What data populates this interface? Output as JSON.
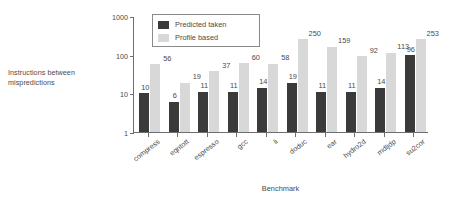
{
  "chart_data": {
    "type": "bar",
    "title": "",
    "xlabel": "Benchmark",
    "ylabel": "Instructions between mispredictions",
    "ylabel_line1": "Instructions between",
    "ylabel_line2": "mispredictions",
    "yscale": "log",
    "ylim": [
      1,
      1000
    ],
    "yticks": [
      1,
      10,
      100,
      1000
    ],
    "ytick_labels": [
      "1",
      "10",
      "100",
      "1000"
    ],
    "grid": false,
    "legend_position": "top-center",
    "categories": [
      "compress",
      "eqntott",
      "espresso",
      "gcc",
      "li",
      "doduc",
      "ear",
      "hydro2d",
      "mdljdp",
      "su2cor"
    ],
    "series": [
      {
        "name": "Predicted taken",
        "color": "#3a3a3a",
        "values": [
          10,
          6,
          11,
          11,
          14,
          19,
          11,
          11,
          14,
          96
        ]
      },
      {
        "name": "Profile based",
        "color": "#d8d8d8",
        "values": [
          56,
          19,
          37,
          60,
          58,
          250,
          159,
          92,
          113,
          253
        ]
      }
    ]
  },
  "legend": {
    "items": [
      {
        "label": "Predicted taken",
        "color": "#3a3a3a"
      },
      {
        "label": "Profile based",
        "color": "#d8d8d8"
      }
    ]
  },
  "colors": {
    "predicted_taken": "#3a3a3a",
    "profile_based": "#d8d8d8",
    "axis": "#6e6e6e",
    "text": "#4a4a4a",
    "background": "#ffffff"
  }
}
